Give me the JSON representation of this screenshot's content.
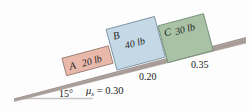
{
  "figure": {
    "background_color": "#fdfdfd"
  },
  "incline": {
    "angle_label": "15°",
    "angle_value": 15,
    "surface_color": "#b9aca8",
    "shade_color": "#8d817e",
    "baseline_color": "#c9c4c2"
  },
  "blocks": [
    {
      "id": "A",
      "name_label": "A",
      "weight_label": "20 lb",
      "weight_value": 20,
      "fill": "#e8b9ab",
      "stroke": "#9b7f76",
      "top_fill": "#f0cfc4"
    },
    {
      "id": "B",
      "name_label": "B",
      "weight_label": "40 lb",
      "weight_value": 40,
      "fill": "#c4d8e6",
      "stroke": "#7d94a4",
      "top_fill": "#d9e7f0"
    },
    {
      "id": "C",
      "name_label": "C",
      "weight_label": "30 lb",
      "weight_value": 30,
      "fill": "#a9c1a4",
      "stroke": "#75907a",
      "top_fill": "#c2d3bd"
    }
  ],
  "friction": [
    {
      "under_block": "A",
      "symbol": "μ",
      "subscript": "s",
      "equals": " = ",
      "value_label": "0.30",
      "value": 0.3
    },
    {
      "under_block": "B",
      "value_label": "0.20",
      "value": 0.2
    },
    {
      "under_block": "C",
      "value_label": "0.35",
      "value": 0.35
    }
  ]
}
